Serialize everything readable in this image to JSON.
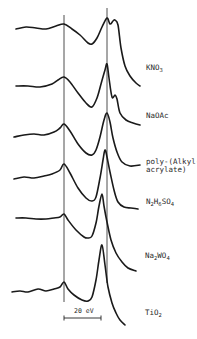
{
  "chart_data": {
    "type": "line",
    "title": "",
    "xlabel": "",
    "ylabel": "",
    "grid": false,
    "legend": "labels placed to the right of each stacked spectrum",
    "scale_bar": {
      "label": "20 eV",
      "x_start_px": 64,
      "x_end_px": 101,
      "y_px": 318
    },
    "reference_lines_px": [
      64,
      107
    ],
    "series": [
      {
        "name": "KNO3",
        "label_main": "KNO",
        "label_sub": "3",
        "label_tail": "",
        "points": [
          [
            16,
            29
          ],
          [
            26,
            27
          ],
          [
            36,
            28
          ],
          [
            46,
            29
          ],
          [
            56,
            26
          ],
          [
            64,
            24
          ],
          [
            72,
            29
          ],
          [
            80,
            35
          ],
          [
            88,
            43
          ],
          [
            92,
            44
          ],
          [
            97,
            38
          ],
          [
            102,
            27
          ],
          [
            107,
            18
          ],
          [
            110,
            24
          ],
          [
            113,
            21
          ],
          [
            115,
            20
          ],
          [
            118,
            25
          ],
          [
            121,
            48
          ],
          [
            125,
            66
          ],
          [
            130,
            76
          ],
          [
            136,
            83
          ],
          [
            140,
            86
          ]
        ]
      },
      {
        "name": "NaOAc",
        "label_main": "NaOAc",
        "label_sub": "",
        "label_tail": "",
        "points": [
          [
            16,
            86
          ],
          [
            28,
            86
          ],
          [
            40,
            87
          ],
          [
            52,
            84
          ],
          [
            58,
            80
          ],
          [
            64,
            77
          ],
          [
            70,
            82
          ],
          [
            78,
            93
          ],
          [
            86,
            103
          ],
          [
            92,
            107
          ],
          [
            97,
            98
          ],
          [
            101,
            84
          ],
          [
            105,
            70
          ],
          [
            107,
            64
          ],
          [
            109,
            78
          ],
          [
            112,
            97
          ],
          [
            115,
            95
          ],
          [
            117,
            99
          ],
          [
            120,
            113
          ],
          [
            126,
            120
          ],
          [
            133,
            123
          ],
          [
            140,
            125
          ]
        ]
      },
      {
        "name": "poly-(Alkyl-acrylate)",
        "label_main": "poly-(Alkyl-",
        "label_sub": "",
        "label_tail": "acrylate)",
        "points": [
          [
            14,
            137
          ],
          [
            24,
            135
          ],
          [
            34,
            134
          ],
          [
            44,
            135
          ],
          [
            54,
            132
          ],
          [
            60,
            128
          ],
          [
            64,
            124
          ],
          [
            70,
            131
          ],
          [
            78,
            144
          ],
          [
            86,
            153
          ],
          [
            92,
            155
          ],
          [
            96,
            150
          ],
          [
            100,
            137
          ],
          [
            104,
            120
          ],
          [
            107,
            113
          ],
          [
            110,
            122
          ],
          [
            113,
            138
          ],
          [
            117,
            152
          ],
          [
            122,
            162
          ],
          [
            130,
            166
          ],
          [
            140,
            165
          ]
        ]
      },
      {
        "name": "N2H6SO4",
        "label_main": "N",
        "label_sub": "2",
        "label_tail": "H6SO4",
        "points": [
          [
            14,
            179
          ],
          [
            24,
            177
          ],
          [
            34,
            178
          ],
          [
            44,
            176
          ],
          [
            52,
            174
          ],
          [
            60,
            170
          ],
          [
            64,
            164
          ],
          [
            70,
            173
          ],
          [
            78,
            188
          ],
          [
            86,
            198
          ],
          [
            92,
            201
          ],
          [
            96,
            197
          ],
          [
            100,
            178
          ],
          [
            103,
            160
          ],
          [
            105,
            150
          ],
          [
            107,
            157
          ],
          [
            110,
            172
          ],
          [
            114,
            190
          ],
          [
            118,
            202
          ],
          [
            124,
            207
          ],
          [
            131,
            208
          ],
          [
            138,
            209
          ]
        ]
      },
      {
        "name": "Na2WO4",
        "label_main": "Na",
        "label_sub": "2",
        "label_tail": "WO4",
        "points": [
          [
            16,
            218
          ],
          [
            26,
            218
          ],
          [
            36,
            219
          ],
          [
            46,
            219
          ],
          [
            54,
            218
          ],
          [
            60,
            217
          ],
          [
            64,
            214
          ],
          [
            68,
            220
          ],
          [
            76,
            230
          ],
          [
            84,
            237
          ],
          [
            88,
            238
          ],
          [
            92,
            236
          ],
          [
            96,
            223
          ],
          [
            99,
            206
          ],
          [
            102,
            194
          ],
          [
            104,
            206
          ],
          [
            107,
            222
          ],
          [
            111,
            240
          ],
          [
            116,
            253
          ],
          [
            122,
            262
          ],
          [
            128,
            268
          ],
          [
            136,
            271
          ]
        ]
      },
      {
        "name": "TiO2",
        "label_main": "TiO",
        "label_sub": "2",
        "label_tail": "",
        "points": [
          [
            12,
            292
          ],
          [
            20,
            291
          ],
          [
            28,
            292
          ],
          [
            38,
            289
          ],
          [
            46,
            291
          ],
          [
            54,
            289
          ],
          [
            60,
            287
          ],
          [
            64,
            282
          ],
          [
            68,
            289
          ],
          [
            74,
            295
          ],
          [
            82,
            300
          ],
          [
            88,
            301
          ],
          [
            92,
            297
          ],
          [
            96,
            280
          ],
          [
            99,
            260
          ],
          [
            102,
            245
          ],
          [
            105,
            265
          ],
          [
            108,
            287
          ],
          [
            112,
            303
          ],
          [
            116,
            313
          ],
          [
            120,
            320
          ],
          [
            125,
            325
          ]
        ]
      }
    ]
  },
  "labels": {
    "kno3": {
      "main": "KNO",
      "sub": "3"
    },
    "naoac": {
      "main": "NaOAc"
    },
    "poly": {
      "line1": "poly-(Alkyl-",
      "line2": "acrylate)"
    },
    "n2h6so4": {
      "a": "N",
      "s1": "2",
      "b": "H",
      "s2": "6",
      "c": "SO",
      "s3": "4"
    },
    "na2wo4": {
      "a": "Na",
      "s1": "2",
      "b": "WO",
      "s2": "4"
    },
    "tio2": {
      "main": "TiO",
      "sub": "2"
    },
    "scale": "20 eV"
  },
  "colors": {
    "ink": "#1a1a1a",
    "background": "#ffffff"
  }
}
